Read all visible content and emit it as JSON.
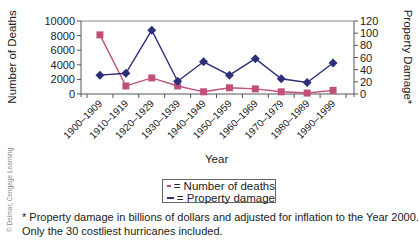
{
  "chart_data": {
    "type": "line",
    "title": "",
    "xlabel": "Year",
    "ylabel_left": "Number of Deaths",
    "ylabel_right": "Property Damage*",
    "categories": [
      "1900–1909",
      "1910–1919",
      "1920–1929",
      "1930–1939",
      "1940–1949",
      "1950–1959",
      "1960–1969",
      "1970–1979",
      "1980–1989",
      "1990–1999"
    ],
    "series": [
      {
        "name": "Number of deaths",
        "axis": "left",
        "color": "#c0507a",
        "marker": "square",
        "values": [
          8100,
          1100,
          2200,
          1100,
          300,
          850,
          700,
          300,
          130,
          500
        ]
      },
      {
        "name": "Property damage",
        "axis": "right",
        "color": "#2e2f7a",
        "marker": "diamond",
        "values": [
          31,
          34,
          105,
          21,
          53,
          31,
          58,
          25,
          19,
          51
        ]
      }
    ],
    "ylim_left": [
      0,
      10000
    ],
    "yticks_left": [
      0,
      2000,
      4000,
      6000,
      8000,
      10000
    ],
    "ylim_right": [
      0,
      120
    ],
    "yticks_right": [
      0,
      20,
      40,
      60,
      80,
      100,
      120
    ],
    "grid": false,
    "legend_position": "bottom-center"
  },
  "legend": {
    "deaths_label": "= Number of deaths",
    "property_label": "= Property damage"
  },
  "footnote": {
    "line1": "* Property damage in billions of dollars and adjusted for inflation to the Year 2000.",
    "line2": "Only the 30 costliest hurricanes included."
  },
  "credit": "© Delmar, Cengage Learning"
}
